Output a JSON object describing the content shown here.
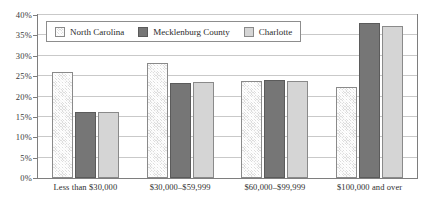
{
  "chart_data": {
    "type": "bar",
    "title": "",
    "xlabel": "",
    "ylabel": "",
    "ylim": [
      0,
      40
    ],
    "ytick_step": 5,
    "ytick_labels": [
      "0%",
      "5%",
      "10%",
      "15%",
      "20%",
      "25%",
      "30%",
      "35%",
      "40%"
    ],
    "grid": true,
    "legend_position": "top-left-inside",
    "categories": [
      "Less than $30,000",
      "$30,000–$59,999",
      "$60,000–$99,999",
      "$100,000 and over"
    ],
    "series": [
      {
        "name": "North Carolina",
        "color": "#dddddd",
        "pattern": "crosshatch",
        "values": [
          26,
          28.2,
          23.9,
          22.4
        ]
      },
      {
        "name": "Mecklenburg County",
        "color": "#767676",
        "pattern": "solid",
        "values": [
          16.2,
          23.2,
          24,
          38
        ]
      },
      {
        "name": "Charlotte",
        "color": "#d5d5d5",
        "pattern": "solid-light",
        "values": [
          16.3,
          23.5,
          23.7,
          37.3
        ]
      }
    ]
  },
  "legend": {
    "items": [
      {
        "label": "North Carolina",
        "swatch": "nc"
      },
      {
        "label": "Mecklenburg County",
        "swatch": "meck"
      },
      {
        "label": "Charlotte",
        "swatch": "char"
      }
    ]
  },
  "colors": {
    "frame": "#7e7e7e",
    "gridline": "#c9c9c9",
    "background": "#ffffff",
    "text": "#2f2f2f"
  }
}
